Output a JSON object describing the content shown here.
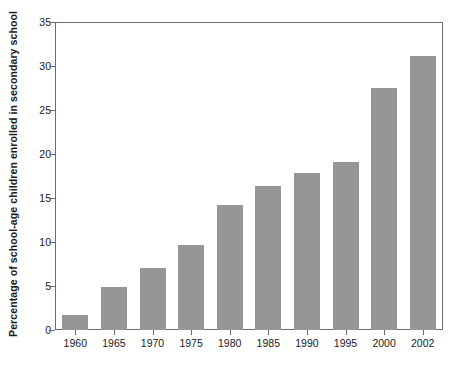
{
  "chart_data": {
    "type": "bar",
    "title": "",
    "xlabel": "",
    "ylabel": "Percentage of school-age children enrolled in secondary school",
    "categories": [
      "1960",
      "1965",
      "1970",
      "1975",
      "1980",
      "1985",
      "1990",
      "1995",
      "2000",
      "2002"
    ],
    "values": [
      1.7,
      4.9,
      7.0,
      9.7,
      14.2,
      16.4,
      17.8,
      19.1,
      27.5,
      31.1
    ],
    "ylim": [
      0,
      35
    ],
    "ytick_labels": [
      "0",
      "5",
      "10",
      "15",
      "20",
      "25",
      "30",
      "35"
    ],
    "ytick_values": [
      0,
      5,
      10,
      15,
      20,
      25,
      30,
      35
    ],
    "grid": false,
    "legend": false,
    "bar_color": "#969696",
    "axis_color": "#6b6b6b",
    "text_color": "#1a1a1a",
    "background": "#ffffff"
  }
}
